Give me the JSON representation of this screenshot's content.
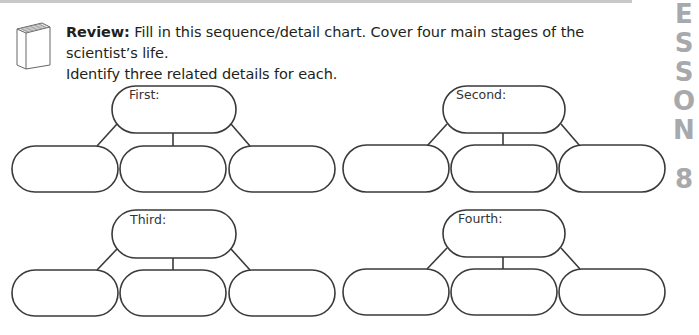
{
  "header": {
    "review_label": "Review:",
    "instruction_line1": " Fill in this sequence/detail chart. Cover four main stages of the scientist’s life.",
    "instruction_line2": "Identify three related details for each."
  },
  "side_tab": {
    "letters": [
      "E",
      "S",
      "S",
      "O",
      "N"
    ],
    "number": "8",
    "color": "#a7a9ac"
  },
  "icons": {
    "book": "book-icon"
  },
  "chart": {
    "stages": [
      {
        "label": "First:",
        "details": [
          "",
          "",
          ""
        ]
      },
      {
        "label": "Second:",
        "details": [
          "",
          "",
          ""
        ]
      },
      {
        "label": "Third:",
        "details": [
          "",
          "",
          ""
        ]
      },
      {
        "label": "Fourth:",
        "details": [
          "",
          "",
          ""
        ]
      }
    ]
  }
}
